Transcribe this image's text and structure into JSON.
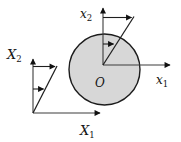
{
  "diagram": {
    "colors": {
      "background": "#ffffff",
      "disk_fill": "#d7d7d7",
      "disk_stroke": "#1c1c1c",
      "line": "#3c3c3c",
      "arrowhead": "#111111"
    },
    "labels": {
      "origin": "O",
      "body_x1": {
        "base": "x",
        "sub": "1"
      },
      "body_x2": {
        "base": "x",
        "sub": "2"
      },
      "space_x1": {
        "base": "X",
        "sub": "1"
      },
      "space_x2": {
        "base": "X",
        "sub": "2"
      }
    }
  }
}
